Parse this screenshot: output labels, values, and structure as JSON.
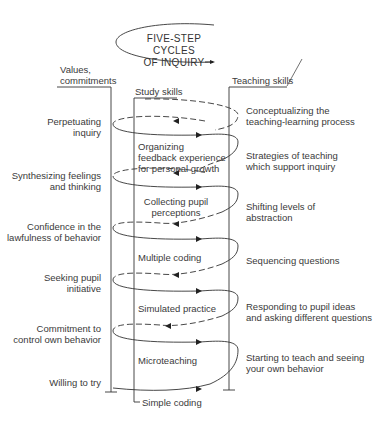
{
  "title": {
    "line1": "FIVE-STEP CYCLES",
    "line2": "OF INQUIRY"
  },
  "columns": {
    "values": {
      "line1": "Values,",
      "line2": "commitments"
    },
    "study": "Study skills",
    "teaching": "Teaching skills"
  },
  "values_items": [
    {
      "line1": "Perpetuating",
      "line2": "inquiry"
    },
    {
      "line1": "Synthesizing feelings",
      "line2": "and thinking"
    },
    {
      "line1": "Confidence in the",
      "line2": "lawfulness of behavior"
    },
    {
      "line1": "Seeking pupil",
      "line2": "initiative"
    },
    {
      "line1": "Commitment to",
      "line2": "control own behavior"
    },
    {
      "line1": "Willing to try",
      "line2": ""
    }
  ],
  "study_items": [
    {
      "line1": "Organizing",
      "line2": "feedback experience",
      "line3": "for personal growth"
    },
    {
      "line1": "Collecting pupil",
      "line2": "perceptions"
    },
    {
      "line1": "Multiple coding"
    },
    {
      "line1": "Simulated practice"
    },
    {
      "line1": "Microteaching"
    },
    {
      "line1": "Simple coding"
    }
  ],
  "teaching_items": [
    {
      "line1": "Conceptualizing the",
      "line2": "teaching-learning process"
    },
    {
      "line1": "Strategies of teaching",
      "line2": "which support inquiry"
    },
    {
      "line1": "Shifting levels of",
      "line2": "abstraction"
    },
    {
      "line1": "Sequencing questions"
    },
    {
      "line1": "Responding to pupil ideas",
      "line2": "and asking different questions"
    },
    {
      "line1": "Starting to teach and seeing",
      "line2": "your own behavior"
    }
  ]
}
